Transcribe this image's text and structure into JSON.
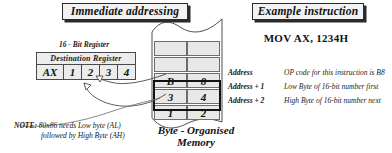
{
  "figure": {
    "title_immediate": "Immediate addressing",
    "title_example": "Example instruction",
    "instruction": "MOV AX, 1234H",
    "memory_caption_line1": "Byte - Organised",
    "memory_caption_line2": "Memory"
  },
  "register": {
    "caption": "16 - Bit Register",
    "header": "Destination Register",
    "name": "AX",
    "nibbles": [
      "1",
      "2",
      "3",
      "4"
    ]
  },
  "memory": {
    "blank_rows": 2,
    "rows": [
      {
        "high": "B",
        "low": "8",
        "highlighted": false
      },
      {
        "high": "3",
        "low": "4",
        "highlighted": true
      },
      {
        "high": "1",
        "low": "2",
        "highlighted": true
      }
    ],
    "annotations": [
      {
        "label": "Address",
        "text": "OP code for this instruction is B8"
      },
      {
        "label": "Address + 1",
        "text": "Low Byte of 16-bit number first"
      },
      {
        "label": "Address + 2",
        "text": "High Byte of 16-bit number next"
      }
    ]
  },
  "note": {
    "key": "NOTE:",
    "line1": "80x86 needs Low byte (AL)",
    "line2": "followed by High Byte (AH)"
  },
  "colors": {
    "cell_fill": "#e8e8e8",
    "box_fill": "#f2f2f2",
    "ink": "#111111",
    "shadow": "#2a2a2a"
  }
}
